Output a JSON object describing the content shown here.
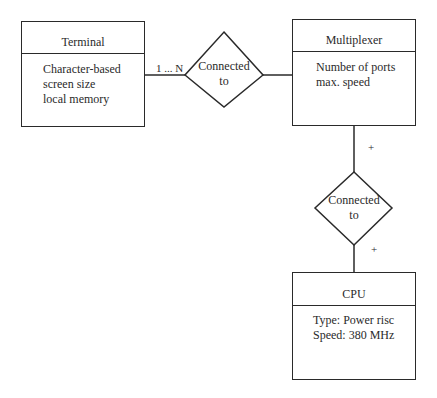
{
  "entities": {
    "terminal": {
      "title": "Terminal",
      "attributes": [
        "Character-based",
        "screen size",
        "local memory"
      ]
    },
    "multiplexer": {
      "title": "Multiplexer",
      "attributes": [
        "Number of ports",
        "max. speed"
      ]
    },
    "cpu": {
      "title": "CPU",
      "attributes": [
        "Type: Power risc",
        "Speed: 380 MHz"
      ]
    }
  },
  "relationships": {
    "terminal_multiplexer": {
      "line1": "Connected",
      "line2": "to",
      "cardinality": "1 ... N"
    },
    "multiplexer_cpu": {
      "line1": "Connected",
      "line2": "to",
      "cardinality_top": "+",
      "cardinality_bottom": "+"
    }
  }
}
